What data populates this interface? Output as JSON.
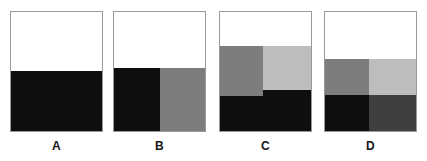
{
  "figure": {
    "type": "fraction-area-diagram",
    "background": "#ffffff",
    "panel_border_color": "#9a9a9a",
    "label_color": "#161616",
    "palette": {
      "white": "#ffffff",
      "black": "#0e0e0e",
      "dark_gray": "#3f3f3f",
      "medium_gray": "#7d7d7d",
      "light_gray": "#bdbdbd"
    }
  },
  "panels": [
    {
      "id": "panel-a",
      "label": "A",
      "frame": {
        "left": 10,
        "top": 11,
        "width": 93,
        "height": 121
      },
      "label_box": {
        "left": 10,
        "top": 139,
        "width": 93
      },
      "shaded_fraction": "1/2",
      "regions": [
        {
          "name": "top-white-half",
          "color": "#ffffff",
          "left": 0,
          "top": 0,
          "width": 91,
          "height": 59
        },
        {
          "name": "bottom-black-half",
          "color": "#0e0e0e",
          "left": 0,
          "top": 59,
          "width": 91,
          "height": 60
        }
      ]
    },
    {
      "id": "panel-b",
      "label": "B",
      "frame": {
        "left": 113,
        "top": 11,
        "width": 93,
        "height": 121
      },
      "label_box": {
        "left": 113,
        "top": 139,
        "width": 93
      },
      "shaded_fraction": "1/2",
      "regions": [
        {
          "name": "top-white-half",
          "color": "#ffffff",
          "left": 0,
          "top": 0,
          "width": 91,
          "height": 56
        },
        {
          "name": "bottom-left-black-quarter",
          "color": "#0e0e0e",
          "left": 0,
          "top": 56,
          "width": 46,
          "height": 63
        },
        {
          "name": "bottom-right-gray-quarter",
          "color": "#7d7d7d",
          "left": 46,
          "top": 56,
          "width": 45,
          "height": 63
        }
      ]
    },
    {
      "id": "panel-c",
      "label": "C",
      "frame": {
        "left": 219,
        "top": 11,
        "width": 93,
        "height": 121
      },
      "label_box": {
        "left": 219,
        "top": 139,
        "width": 93
      },
      "shaded_fraction": "3/4",
      "regions": [
        {
          "name": "top-white-band",
          "color": "#ffffff",
          "left": 0,
          "top": 0,
          "width": 91,
          "height": 34
        },
        {
          "name": "left-medium-gray-block",
          "color": "#7d7d7d",
          "left": 0,
          "top": 34,
          "width": 43,
          "height": 50
        },
        {
          "name": "right-light-gray-block",
          "color": "#bdbdbd",
          "left": 43,
          "top": 34,
          "width": 48,
          "height": 44
        },
        {
          "name": "right-black-block",
          "color": "#0e0e0e",
          "left": 43,
          "top": 78,
          "width": 48,
          "height": 41
        },
        {
          "name": "bottom-left-black-band",
          "color": "#0e0e0e",
          "left": 0,
          "top": 84,
          "width": 43,
          "height": 35
        }
      ]
    },
    {
      "id": "panel-d",
      "label": "D",
      "frame": {
        "left": 324,
        "top": 11,
        "width": 93,
        "height": 121
      },
      "label_box": {
        "left": 324,
        "top": 139,
        "width": 93
      },
      "shaded_fraction": "3/4",
      "regions": [
        {
          "name": "top-white-band",
          "color": "#ffffff",
          "left": 0,
          "top": 0,
          "width": 91,
          "height": 47
        },
        {
          "name": "mid-left-medium-gray",
          "color": "#7d7d7d",
          "left": 0,
          "top": 47,
          "width": 44,
          "height": 36
        },
        {
          "name": "mid-right-light-gray",
          "color": "#bdbdbd",
          "left": 44,
          "top": 47,
          "width": 47,
          "height": 36
        },
        {
          "name": "bottom-left-black",
          "color": "#0e0e0e",
          "left": 0,
          "top": 83,
          "width": 44,
          "height": 36
        },
        {
          "name": "bottom-right-dark-gray",
          "color": "#3f3f3f",
          "left": 44,
          "top": 83,
          "width": 47,
          "height": 36
        }
      ]
    }
  ]
}
